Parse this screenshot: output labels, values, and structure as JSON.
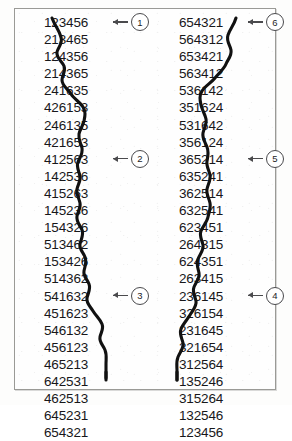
{
  "figure": {
    "frame_color": "#9a9a96",
    "text_color": "#17171a",
    "curve_color": "#111111",
    "callout_color": "#4a4a4d"
  },
  "columns": [
    {
      "name": "left-column",
      "rows": [
        "123456",
        "213465",
        "124356",
        "214365",
        "241635",
        "426153",
        "246135",
        "421653",
        "412563",
        "142536",
        "415263",
        "145236",
        "154326",
        "513462",
        "153426",
        "514362",
        "541632",
        "451623",
        "546132",
        "456123",
        "465213",
        "642531",
        "462513",
        "645231",
        "654321"
      ]
    },
    {
      "name": "right-column",
      "rows": [
        "654321",
        "564312",
        "653421",
        "563412",
        "536142",
        "351624",
        "531642",
        "356124",
        "365214",
        "635241",
        "362514",
        "632541",
        "623451",
        "264315",
        "624351",
        "263415",
        "236145",
        "326154",
        "231645",
        "321654",
        "312564",
        "135246",
        "315264",
        "132546",
        "123456"
      ]
    }
  ],
  "callouts": [
    {
      "label": "1",
      "side": "left",
      "row_index": 0,
      "arrow": "left-arrow"
    },
    {
      "label": "2",
      "side": "left",
      "row_index": 8,
      "arrow": "left-arrow"
    },
    {
      "label": "3",
      "side": "left",
      "row_index": 16,
      "arrow": "left-arrow"
    },
    {
      "label": "6",
      "side": "right",
      "row_index": 0,
      "arrow": "left-arrow"
    },
    {
      "label": "5",
      "side": "right",
      "row_index": 8,
      "arrow": "left-arrow"
    },
    {
      "label": "4",
      "side": "right",
      "row_index": 16,
      "arrow": "left-arrow"
    }
  ]
}
